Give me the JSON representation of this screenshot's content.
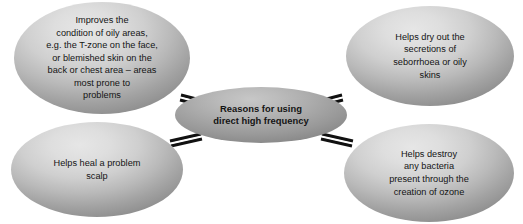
{
  "diagram": {
    "type": "hub-and-spoke",
    "background_color": "#ffffff",
    "node_fill_light": "#cfcfcf",
    "node_fill_dark": "#9a9a9a",
    "connector_color": "#111111",
    "text_color": "#141414",
    "hub": {
      "id": "hub",
      "label": "Reasons for using\ndirect high frequency"
    },
    "satellites": [
      {
        "id": "oily-areas",
        "position": "top-left",
        "label": "Improves the\ncondition of oily areas,\ne.g. the T-zone on the face,\nor blemished skin on the\nback or chest area – areas\nmost prone to\nproblems"
      },
      {
        "id": "seborrhoea",
        "position": "top-right",
        "label": "Helps dry out the\nsecretions of\nseborrhoea or oily\nskins"
      },
      {
        "id": "scalp",
        "position": "bottom-left",
        "label": "Helps heal a problem\nscalp"
      },
      {
        "id": "ozone",
        "position": "bottom-right",
        "label": "Helps destroy\nany bacteria\npresent through the\ncreation of ozone"
      }
    ],
    "connectors": [
      {
        "id": "hub-to-oily-areas",
        "from": "hub",
        "to": "oily-areas"
      },
      {
        "id": "hub-to-seborrhoea",
        "from": "hub",
        "to": "seborrhoea"
      },
      {
        "id": "hub-to-scalp",
        "from": "hub",
        "to": "scalp"
      },
      {
        "id": "hub-to-ozone",
        "from": "hub",
        "to": "ozone"
      }
    ]
  }
}
